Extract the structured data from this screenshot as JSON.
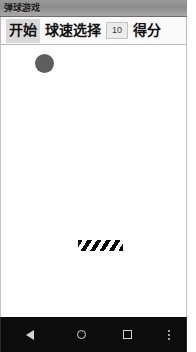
{
  "window": {
    "title": "弹球游戏"
  },
  "toolbar": {
    "start_label": "开始",
    "speed_label": "球速选择",
    "speed_value": "10",
    "score_label": "得分"
  },
  "game": {
    "ball": {
      "color": "#5e5e5e",
      "diameter_px": 19,
      "x_px": 34,
      "y_px": 9
    },
    "paddle": {
      "stripe_colors": [
        "#0a0a0a",
        "#ffffff"
      ],
      "width_px": 45,
      "height_px": 11,
      "x_px": 77,
      "y_px": 195
    },
    "background_color": "#ffffff"
  },
  "nav_bar": {
    "background_color": "#0c0c0c",
    "icon_color": "#d2d2d2",
    "buttons": [
      {
        "name": "back",
        "icon": "triangle-left-icon"
      },
      {
        "name": "home",
        "icon": "circle-icon"
      },
      {
        "name": "recent",
        "icon": "square-icon"
      },
      {
        "name": "menu",
        "icon": "overflow-dots-icon"
      }
    ]
  }
}
